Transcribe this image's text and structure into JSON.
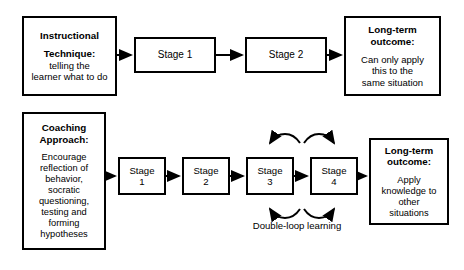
{
  "diagram": {
    "title_hidden": "Instructional technique versus coaching approach",
    "top_row": {
      "source": {
        "title_line1": "Instructional",
        "title_line2": "Technique:",
        "body_line1": "telling the",
        "body_line2": "learner what to do"
      },
      "stages": [
        {
          "label": "Stage 1"
        },
        {
          "label": "Stage 2"
        }
      ],
      "outcome": {
        "title_line1": "Long-term",
        "title_line2": "outcome:",
        "body_line1": "Can only apply",
        "body_line2": "this to the",
        "body_line3": "same situation"
      }
    },
    "bottom_row": {
      "source": {
        "title_line1": "Coaching",
        "title_line2": "Approach:",
        "body_line1": "Encourage",
        "body_line2": "reflection of",
        "body_line3": "behavior,",
        "body_line4": "socratic",
        "body_line5": "questioning,",
        "body_line6": "testing and",
        "body_line7": "forming",
        "body_line8": "hypotheses"
      },
      "stages": [
        {
          "word": "Stage",
          "number": "1"
        },
        {
          "word": "Stage",
          "number": "2"
        },
        {
          "word": "Stage",
          "number": "3"
        },
        {
          "word": "Stage",
          "number": "4"
        }
      ],
      "loop_label": "Double-loop learning",
      "outcome": {
        "title_line1": "Long-term",
        "title_line2": "outcome:",
        "body_line1": "Apply",
        "body_line2": "knowledge to",
        "body_line3": "other",
        "body_line4": "situations"
      }
    },
    "colors": {
      "stroke": "#000000",
      "background": "#ffffff",
      "text": "#000000"
    }
  }
}
